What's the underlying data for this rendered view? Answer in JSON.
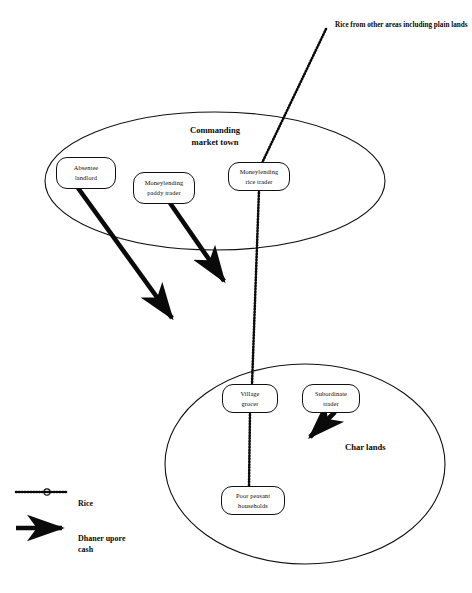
{
  "diagram": {
    "title_note": "Rice from other areas including plain lands",
    "zones": [
      {
        "id": "commanding-market-town",
        "label_line1": "Commanding",
        "label_line2": "market town"
      },
      {
        "id": "char-lands",
        "label_line1": "Char lands",
        "label_line2": ""
      }
    ],
    "nodes": [
      {
        "id": "absentee-landlord",
        "line1": "Absentee",
        "line2": "landlord"
      },
      {
        "id": "moneylending-paddy-trader",
        "line1": "Moneylending",
        "line2": "paddy trader"
      },
      {
        "id": "moneylending-rice-trader",
        "line1": "Moneylending",
        "line2": "rice trader"
      },
      {
        "id": "village-grocer",
        "line1": "Village",
        "line2": "grocer"
      },
      {
        "id": "subordinate-trader",
        "line1": "Subordinate",
        "line2": "trader"
      },
      {
        "id": "poor-peasant-households",
        "line1": "Poor peasant",
        "line2": "households"
      }
    ],
    "legend": {
      "rice": {
        "symbol": "rice-chain-line-icon",
        "label": "Rice"
      },
      "cash": {
        "symbol": "solid-arrow-icon",
        "label": "Dhaner upore\ncash"
      }
    },
    "colors": {
      "ink": "#0a0a0a",
      "outline": "#111111",
      "background": "#ffffff"
    }
  }
}
